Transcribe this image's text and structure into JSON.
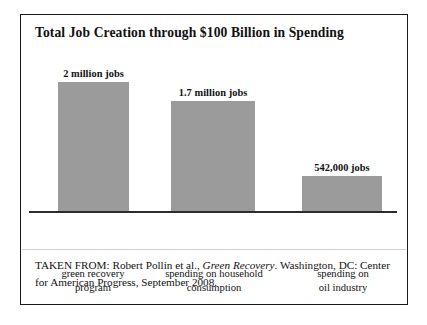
{
  "figure": {
    "title": "Total Job Creation through $100 Billion in Spending",
    "source": {
      "prefix": "TAKEN FROM: Robert Pollin et al., ",
      "work_title": "Green Recovery",
      "suffix": ". Washington, DC: Center for American Progress, September 2008."
    }
  },
  "chart_data": {
    "type": "bar",
    "title": "Total Job Creation through $100 Billion in Spending",
    "xlabel": "",
    "ylabel": "",
    "grid": false,
    "legend": "none",
    "axis_line": "baseline only",
    "bar_color": "#9b9b9b",
    "ylim": [
      0,
      2000000
    ],
    "categories": [
      "green recovery program",
      "spending on household consumption",
      "spending on oil industry"
    ],
    "category_lines": [
      [
        "green recovery",
        "program"
      ],
      [
        "spending on household",
        "consumption"
      ],
      [
        "spending on",
        "oil industry"
      ]
    ],
    "values": [
      2000000,
      1700000,
      542000
    ],
    "value_labels": [
      "2 million jobs",
      "1.7 million jobs",
      "542,000 jobs"
    ]
  }
}
